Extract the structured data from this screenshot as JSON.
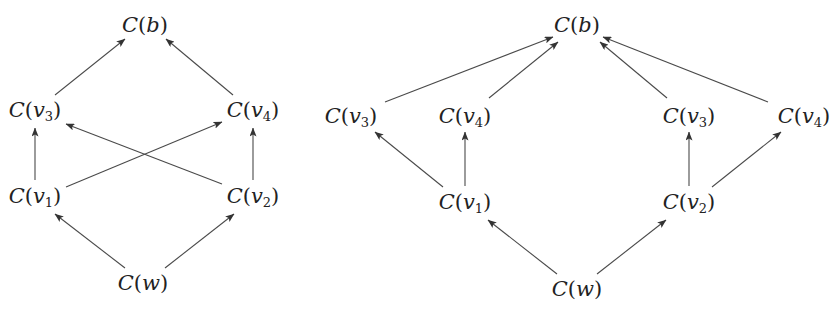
{
  "diagrams": [
    {
      "id": "left",
      "nodes": [
        {
          "id": "b",
          "func": "C",
          "var": "b",
          "sub": "",
          "x": 145,
          "y": 25
        },
        {
          "id": "v3",
          "func": "C",
          "var": "v",
          "sub": "3",
          "x": 35,
          "y": 110
        },
        {
          "id": "v4",
          "func": "C",
          "var": "v",
          "sub": "4",
          "x": 253,
          "y": 110
        },
        {
          "id": "v1",
          "func": "C",
          "var": "v",
          "sub": "1",
          "x": 35,
          "y": 196
        },
        {
          "id": "v2",
          "func": "C",
          "var": "v",
          "sub": "2",
          "x": 253,
          "y": 196
        },
        {
          "id": "w",
          "func": "C",
          "var": "w",
          "sub": "",
          "x": 143,
          "y": 283
        }
      ],
      "edges": [
        {
          "from": "v3",
          "to": "b",
          "x1": 55,
          "y1": 95,
          "x2": 125,
          "y2": 39
        },
        {
          "from": "v4",
          "to": "b",
          "x1": 233,
          "y1": 95,
          "x2": 166,
          "y2": 39
        },
        {
          "from": "v1",
          "to": "v3",
          "x1": 35,
          "y1": 180,
          "x2": 35,
          "y2": 128
        },
        {
          "from": "v2",
          "to": "v4",
          "x1": 253,
          "y1": 180,
          "x2": 253,
          "y2": 128
        },
        {
          "from": "v1",
          "to": "v4",
          "x1": 66,
          "y1": 187,
          "x2": 222,
          "y2": 122
        },
        {
          "from": "v2",
          "to": "v3",
          "x1": 222,
          "y1": 184,
          "x2": 66,
          "y2": 124
        },
        {
          "from": "w",
          "to": "v1",
          "x1": 125,
          "y1": 268,
          "x2": 55,
          "y2": 214
        },
        {
          "from": "w",
          "to": "v2",
          "x1": 165,
          "y1": 268,
          "x2": 234,
          "y2": 214
        }
      ]
    },
    {
      "id": "right",
      "nodes": [
        {
          "id": "b",
          "func": "C",
          "var": "b",
          "sub": "",
          "x": 577,
          "y": 25
        },
        {
          "id": "v3a",
          "func": "C",
          "var": "v",
          "sub": "3",
          "x": 351,
          "y": 116
        },
        {
          "id": "v4a",
          "func": "C",
          "var": "v",
          "sub": "4",
          "x": 465,
          "y": 116
        },
        {
          "id": "v1",
          "func": "C",
          "var": "v",
          "sub": "1",
          "x": 465,
          "y": 202
        },
        {
          "id": "v3b",
          "func": "C",
          "var": "v",
          "sub": "3",
          "x": 689,
          "y": 116
        },
        {
          "id": "v4b",
          "func": "C",
          "var": "v",
          "sub": "4",
          "x": 804,
          "y": 116
        },
        {
          "id": "v2",
          "func": "C",
          "var": "v",
          "sub": "2",
          "x": 689,
          "y": 202
        },
        {
          "id": "w",
          "func": "C",
          "var": "w",
          "sub": "",
          "x": 577,
          "y": 289
        }
      ],
      "edges": [
        {
          "from": "v3a",
          "to": "b",
          "x1": 385,
          "y1": 102,
          "x2": 553,
          "y2": 37
        },
        {
          "from": "v4a",
          "to": "b",
          "x1": 489,
          "y1": 98,
          "x2": 558,
          "y2": 42
        },
        {
          "from": "v3b",
          "to": "b",
          "x1": 667,
          "y1": 98,
          "x2": 600,
          "y2": 42
        },
        {
          "from": "v4b",
          "to": "b",
          "x1": 768,
          "y1": 102,
          "x2": 603,
          "y2": 37
        },
        {
          "from": "v1",
          "to": "v3a",
          "x1": 443,
          "y1": 187,
          "x2": 375,
          "y2": 132
        },
        {
          "from": "v1",
          "to": "v4a",
          "x1": 465,
          "y1": 186,
          "x2": 465,
          "y2": 132
        },
        {
          "from": "v2",
          "to": "v3b",
          "x1": 689,
          "y1": 186,
          "x2": 689,
          "y2": 132
        },
        {
          "from": "v2",
          "to": "v4b",
          "x1": 712,
          "y1": 187,
          "x2": 781,
          "y2": 132
        },
        {
          "from": "w",
          "to": "v1",
          "x1": 557,
          "y1": 274,
          "x2": 488,
          "y2": 220
        },
        {
          "from": "w",
          "to": "v2",
          "x1": 597,
          "y1": 274,
          "x2": 666,
          "y2": 220
        }
      ]
    }
  ],
  "colors": {
    "edge": "#4a4a4a",
    "text": "#222222",
    "background": "#ffffff"
  }
}
